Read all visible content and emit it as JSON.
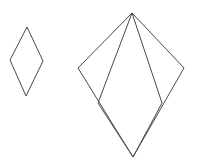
{
  "canvas": {
    "width": 198,
    "height": 162,
    "background_color": "#ffffff",
    "stroke_color": "#4a4a4a",
    "stroke_width": 1,
    "fill": "none"
  },
  "figures": [
    {
      "name": "small-rhombus",
      "label": "Small rhombus",
      "type": "polygon",
      "closed": true,
      "vertices": [
        {
          "name": "top",
          "x": 27,
          "y": 27
        },
        {
          "name": "right",
          "x": 43,
          "y": 61
        },
        {
          "name": "bottom",
          "x": 26,
          "y": 96
        },
        {
          "name": "left",
          "x": 10,
          "y": 60
        }
      ],
      "points_attr": "27,27 43,61 26,96 10,60",
      "bbox": {
        "x": 10,
        "y": 27,
        "width": 33,
        "height": 69
      }
    },
    {
      "name": "large-kite",
      "label": "Large kite outline",
      "type": "polygon",
      "closed": true,
      "vertices": [
        {
          "name": "apex",
          "x": 132,
          "y": 13
        },
        {
          "name": "right-wing",
          "x": 184,
          "y": 68
        },
        {
          "name": "bottom",
          "x": 133,
          "y": 157
        },
        {
          "name": "left-wing",
          "x": 78,
          "y": 68
        }
      ],
      "points_attr": "132,13 184,68 133,157 78,68",
      "bbox": {
        "x": 78,
        "y": 13,
        "width": 106,
        "height": 144
      }
    },
    {
      "name": "inner-petal",
      "label": "Inner petal",
      "type": "polygon",
      "closed": true,
      "vertices": [
        {
          "name": "apex",
          "x": 132,
          "y": 13
        },
        {
          "name": "inner-right",
          "x": 162,
          "y": 103
        },
        {
          "name": "bottom",
          "x": 133,
          "y": 157
        },
        {
          "name": "inner-left",
          "x": 98,
          "y": 103
        }
      ],
      "points_attr": "132,13 162,103 133,157 98,103",
      "bbox": {
        "x": 98,
        "y": 13,
        "width": 64,
        "height": 144
      }
    }
  ]
}
